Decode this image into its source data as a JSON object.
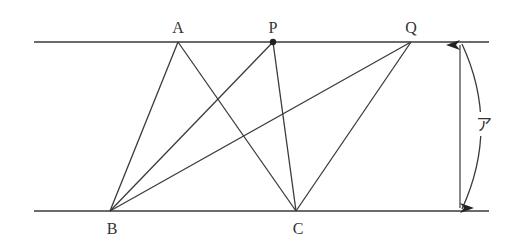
{
  "diagram": {
    "type": "geometry",
    "colors": {
      "stroke": "#3a3a3a",
      "text": "#333333",
      "background": "#ffffff"
    },
    "points": {
      "A": {
        "label": "A",
        "x": 178,
        "y": 42
      },
      "P": {
        "label": "P",
        "x": 273,
        "y": 42
      },
      "Q": {
        "label": "Q",
        "x": 411,
        "y": 42
      },
      "B": {
        "label": "B",
        "x": 110,
        "y": 211
      },
      "C": {
        "label": "C",
        "x": 296,
        "y": 211
      }
    },
    "parallel_lines": [
      {
        "name": "top-line",
        "x1": 34,
        "x2": 489,
        "y": 42
      },
      {
        "name": "bottom-line",
        "x1": 34,
        "x2": 489,
        "y": 211
      }
    ],
    "segments": [
      [
        "A",
        "B"
      ],
      [
        "A",
        "C"
      ],
      [
        "P",
        "B"
      ],
      [
        "P",
        "C"
      ],
      [
        "Q",
        "B"
      ],
      [
        "Q",
        "C"
      ]
    ],
    "distance_marker": {
      "label": "ア",
      "x": 460
    }
  }
}
